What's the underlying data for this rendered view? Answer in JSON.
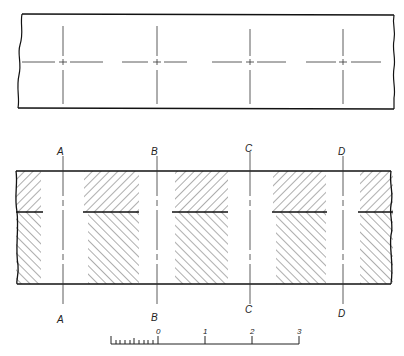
{
  "diagram": {
    "type": "technical-drawing",
    "top_view": {
      "description": "Plan view of strip with four centre-mark crosshairs",
      "crosshair_count": 4
    },
    "section_view": {
      "description": "Sectional view with hatched regions and cutting planes",
      "section_labels_top": [
        "A",
        "B",
        "C",
        "D"
      ],
      "section_labels_bottom": [
        "A",
        "B",
        "C",
        "D"
      ]
    },
    "scale_bar": {
      "tick_labels": [
        "0",
        "1",
        "2",
        "3"
      ],
      "subdivisions_left_of_zero": 10
    }
  }
}
